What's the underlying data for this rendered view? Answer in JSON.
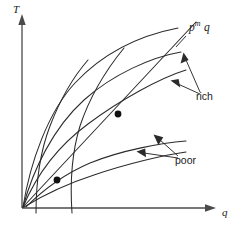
{
  "figure": {
    "kind": "line-diagram",
    "background_color": "#ffffff",
    "line_color": "#2b2b2b",
    "axis_color": "#4a4a4a",
    "axes": {
      "y": {
        "label": "T",
        "name": "temperature-axis",
        "orientation": "vertical",
        "arrow": "up",
        "origin_px": [
          22,
          208
        ],
        "end_px": [
          22,
          16
        ]
      },
      "x": {
        "label": "q",
        "name": "quantity-axis",
        "orientation": "horizontal",
        "arrow": "right",
        "origin_px": [
          22,
          208
        ],
        "end_px": [
          216,
          208
        ]
      }
    },
    "annotations": [
      {
        "id": "pmq",
        "text_parts": {
          "base": "p",
          "sup": "m",
          "tail": "q"
        },
        "plain_text": "p m q",
        "points_to": "upper-envelope-ray-endpoint"
      },
      {
        "id": "rich",
        "text": "rich",
        "arrow_count": 2,
        "points_to": [
          "rich-curve-upper",
          "rich-curve-lower"
        ]
      },
      {
        "id": "poor",
        "text": "poor",
        "arrow_count": 2,
        "points_to": [
          "poor-curve-upper",
          "poor-curve-lower"
        ]
      }
    ],
    "markers": [
      {
        "id": "tangency-upper",
        "shape": "dot",
        "px": [
          118,
          114
        ]
      },
      {
        "id": "tangency-lower",
        "shape": "dot",
        "px": [
          57,
          180
        ]
      }
    ],
    "curves": [
      {
        "id": "outer-envelope",
        "description": "tall concave curve from origin rising to upper right"
      },
      {
        "id": "rich-curve-upper",
        "description": "concave curve ending near ray endpoint"
      },
      {
        "id": "rich-curve-lower",
        "description": "concave curve below upper rich curve"
      },
      {
        "id": "poor-curve-upper",
        "description": "shallow concave curve in lower middle"
      },
      {
        "id": "poor-curve-lower",
        "description": "shallow concave curve below poor upper curve"
      },
      {
        "id": "steep-curve-left",
        "description": "steep curve crossing x-axis near q=36"
      },
      {
        "id": "steep-curve-right",
        "description": "steep curve crossing x-axis near q=72"
      },
      {
        "id": "budget-ray",
        "description": "straight ray from origin through both dots to upper right"
      }
    ]
  }
}
